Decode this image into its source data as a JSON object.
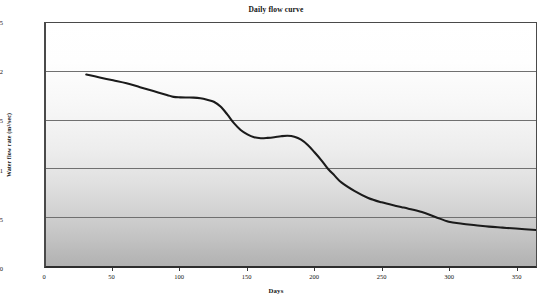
{
  "chart_data": {
    "type": "line",
    "title": "Daily flow curve",
    "xlabel": "Days",
    "ylabel": "Water flow rate (m³/sec)",
    "xlim": [
      0,
      365
    ],
    "ylim": [
      0,
      2.5
    ],
    "grid": true,
    "legend": "none",
    "x_ticks": [
      "0",
      "50",
      "100",
      "150",
      "200",
      "250",
      "300",
      "350"
    ],
    "x_tick_values": [
      0,
      50,
      100,
      150,
      200,
      250,
      300,
      350
    ],
    "y_ticks": [
      "0",
      "0,5",
      "1",
      "1,5",
      "2",
      "2,5"
    ],
    "y_tick_values": [
      0,
      0.5,
      1,
      1.5,
      2,
      2.5
    ],
    "series": [
      {
        "name": "Daily flow",
        "color": "#1b1b1b",
        "x": [
          30,
          40,
          50,
          60,
          70,
          80,
          90,
          95,
          100,
          105,
          110,
          115,
          120,
          125,
          130,
          135,
          140,
          145,
          150,
          155,
          160,
          165,
          170,
          175,
          180,
          185,
          190,
          195,
          200,
          205,
          210,
          215,
          220,
          230,
          240,
          250,
          260,
          265,
          270,
          280,
          290,
          300,
          310,
          320,
          330,
          340,
          350,
          365
        ],
        "y": [
          1.97,
          1.94,
          1.91,
          1.88,
          1.84,
          1.8,
          1.76,
          1.74,
          1.735,
          1.733,
          1.732,
          1.725,
          1.71,
          1.69,
          1.64,
          1.56,
          1.47,
          1.4,
          1.355,
          1.325,
          1.315,
          1.318,
          1.325,
          1.335,
          1.34,
          1.33,
          1.3,
          1.245,
          1.17,
          1.09,
          1.0,
          0.93,
          0.86,
          0.77,
          0.7,
          0.655,
          0.62,
          0.605,
          0.59,
          0.555,
          0.505,
          0.455,
          0.435,
          0.42,
          0.405,
          0.395,
          0.385,
          0.37
        ]
      }
    ],
    "colors": {
      "curve": "#1b1b1b",
      "gridline": "#6f6f6f",
      "axis": "#3a3a3a",
      "plot_bg_top": "#ffffff",
      "plot_bg_bottom": "#b2b2b2",
      "page_bg": "#ffffff",
      "text": "#131313"
    }
  }
}
